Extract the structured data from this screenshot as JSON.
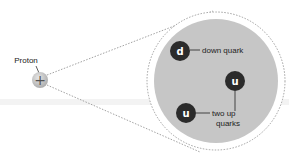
{
  "diagram": {
    "proton": {
      "label": "Proton",
      "symbol": "+"
    },
    "quarks": [
      {
        "letter": "d",
        "name": "down quark"
      },
      {
        "letter": "u",
        "name": "up quark"
      },
      {
        "letter": "u",
        "name": "up quark"
      }
    ],
    "labels": {
      "down": "down quark",
      "up_line1": "two up",
      "up_line2": "quarks"
    },
    "colors": {
      "proton_fill": "#c8c8c8",
      "nucleus_fill": "#c6c6c6",
      "quark_fill": "#2b2b2b",
      "dotted": "#8a8a8a"
    }
  }
}
